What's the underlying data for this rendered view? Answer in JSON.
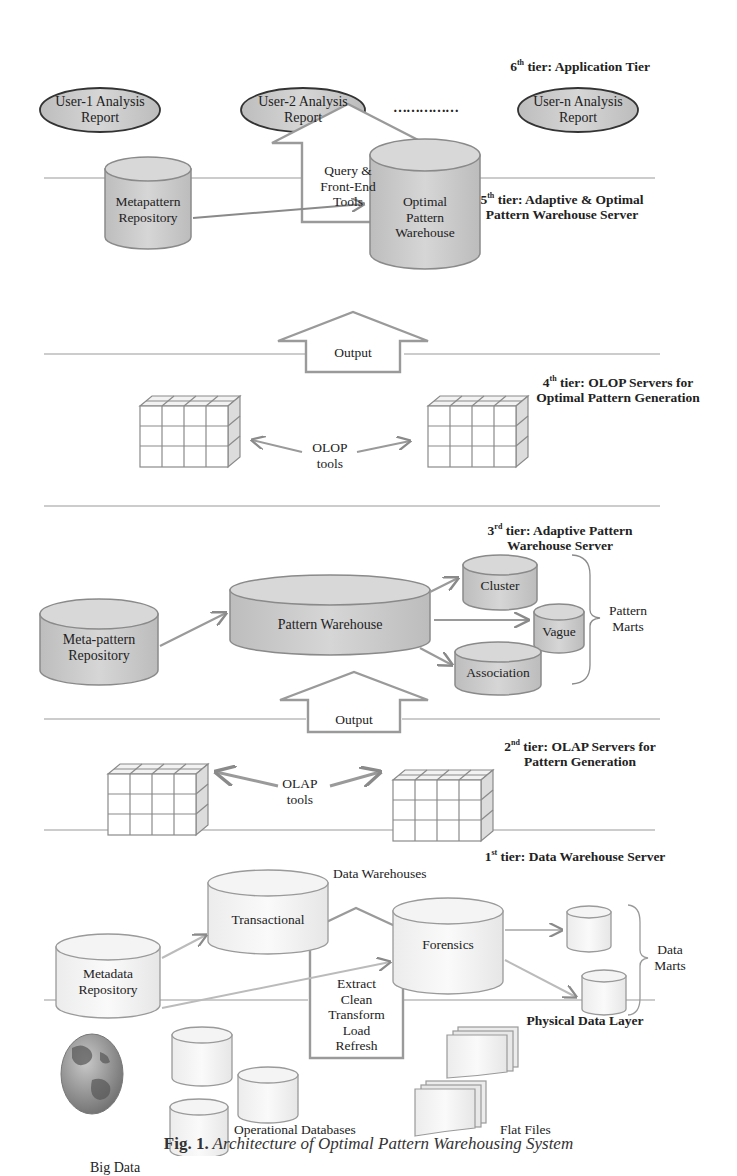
{
  "figure": {
    "caption_label": "Fig. 1.",
    "caption_text": "Architecture of Optimal Pattern Warehousing System"
  },
  "tiers": {
    "tier6": {
      "ord": "6",
      "sup": "th",
      "title": "tier: Application Tier"
    },
    "tier5": {
      "ord": "5",
      "sup": "th",
      "title_line1": "tier: Adaptive & Optimal",
      "title_line2": "Pattern Warehouse Server"
    },
    "tier4": {
      "ord": "4",
      "sup": "th",
      "title_line1": "tier: OLOP Servers for",
      "title_line2": "Optimal Pattern Generation"
    },
    "tier3": {
      "ord": "3",
      "sup": "rd",
      "title_line1": "tier: Adaptive Pattern",
      "title_line2": "Warehouse Server"
    },
    "tier2": {
      "ord": "2",
      "sup": "nd",
      "title_line1": "tier: OLAP Servers for",
      "title_line2": "Pattern Generation"
    },
    "tier1": {
      "ord": "1",
      "sup": "st",
      "title": "tier: Data Warehouse Server"
    },
    "physical": {
      "title": "Physical Data Layer"
    }
  },
  "application_tier": {
    "reports": [
      {
        "line1": "User-1 Analysis",
        "line2": "Report"
      },
      {
        "line1": "User-2 Analysis",
        "line2": "Report"
      },
      {
        "line1": "User-n Analysis",
        "line2": "Report"
      }
    ],
    "ellipsis": "……………",
    "up_arrow": {
      "line1": "Query &",
      "line2": "Front-End",
      "line3": "Tools"
    }
  },
  "optimal_tier": {
    "metapattern": {
      "line1": "Metapattern",
      "line2": "Repository"
    },
    "optimal_warehouse": {
      "line1": "Optimal",
      "line2": "Pattern",
      "line3": "Warehouse"
    },
    "up_arrow": "Output"
  },
  "olop_tier": {
    "tools_line1": "OLOP",
    "tools_line2": "tools"
  },
  "adaptive_tier": {
    "meta_pattern": {
      "line1": "Meta-pattern",
      "line2": "Repository"
    },
    "pattern_warehouse": "Pattern Warehouse",
    "marts": [
      "Cluster",
      "Vague",
      "Association"
    ],
    "marts_label_line1": "Pattern",
    "marts_label_line2": "Marts",
    "up_arrow": "Output"
  },
  "olap_tier": {
    "tools_line1": "OLAP",
    "tools_line2": "tools"
  },
  "dw_tier": {
    "metadata": {
      "line1": "Metadata",
      "line2": "Repository"
    },
    "transactional": "Transactional",
    "forensics": "Forensics",
    "warehouses_label": "Data Warehouses",
    "marts_label_line1": "Data",
    "marts_label_line2": "Marts"
  },
  "etl_arrow": [
    "Extract",
    "Clean",
    "Transform",
    "Load",
    "Refresh"
  ],
  "physical_layer": {
    "big_data": "Big Data",
    "operational": "Operational Databases",
    "flat_files": "Flat Files"
  },
  "colors": {
    "grey_fill": "#cfcfcf",
    "light_fill": "#f4f4f4",
    "stroke": "#8a8a8a",
    "ellipse_stroke": "#333333",
    "divider": "#9a9a9a"
  }
}
